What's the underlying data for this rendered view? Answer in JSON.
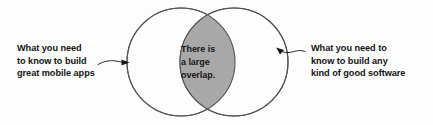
{
  "diagram": {
    "type": "venn-two-circle",
    "title": "",
    "background_color": "#fdfdfd",
    "overlap_fill_color": "#a8a8a8",
    "circle_stroke_color": "#555555",
    "circle_fill_color": "#fdfdfd",
    "text_color": "#131313",
    "left_circle": {
      "label_lines": [
        "What you need",
        "to know to build",
        "great mobile apps"
      ],
      "center_x": 181,
      "center_y": 62,
      "radius": 54
    },
    "right_circle": {
      "label_lines": [
        "What you need to",
        "know to build any",
        "kind of good software"
      ],
      "center_x": 234,
      "center_y": 62,
      "radius": 54
    },
    "overlap": {
      "label_lines": [
        "There is",
        "a large",
        "overlap."
      ]
    },
    "left_arrow": {
      "icon": "wavy-arrow-right-icon",
      "points_to": "left-circle"
    },
    "right_arrow": {
      "icon": "wavy-arrow-left-icon",
      "points_to": "right-circle"
    }
  }
}
